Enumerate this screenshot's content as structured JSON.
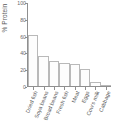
{
  "chart_data": {
    "type": "bar",
    "title": "",
    "subtitle": "",
    "xlabel": "",
    "ylabel": "% Protein",
    "categories": [
      "Dried fish",
      "Soya beans",
      "Broad beans",
      "Fresh fish",
      "Meat",
      "Eggs",
      "Cow's milk",
      "Cabbage"
    ],
    "values": [
      62,
      36,
      30,
      28,
      27,
      20,
      5,
      1
    ],
    "ylim": [
      0,
      100
    ],
    "yticks": [
      0,
      20,
      40,
      60,
      80,
      100
    ],
    "ytick_labels": [
      "0",
      "20",
      "40",
      "60",
      "80",
      "100"
    ],
    "grid": false,
    "legend": false,
    "legend_position": "none",
    "bar_fill_color": "#fdfdfd",
    "bar_edge_color": "#b9b9b9",
    "axis_color": "#8f8f8f",
    "text_color": "#555555",
    "background_color": "#ffffff"
  }
}
